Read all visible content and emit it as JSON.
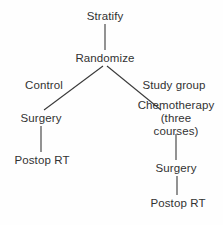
{
  "figure": {
    "type": "flowchart",
    "background_color": "#fefefe",
    "line_color": "#3a3a3a",
    "text_color": "#323232"
  },
  "nodes": [
    {
      "id": "stratify",
      "label": "Stratify",
      "x": 105,
      "y": 16
    },
    {
      "id": "randomize",
      "label": "Randomize",
      "x": 105,
      "y": 58
    },
    {
      "id": "surgery_control",
      "label": "Surgery",
      "x": 41,
      "y": 118
    },
    {
      "id": "chemotherapy",
      "label": "Chemotherapy",
      "line2": "(three courses)",
      "x": 176,
      "y": 118
    },
    {
      "id": "postop_rt_control",
      "label": "Postop RT",
      "x": 42,
      "y": 160
    },
    {
      "id": "surgery_study",
      "label": "Surgery",
      "x": 176,
      "y": 168
    },
    {
      "id": "postop_rt_study",
      "label": "Postop RT",
      "x": 178,
      "y": 203
    }
  ],
  "edge_labels": [
    {
      "id": "control_arm",
      "label": "Control",
      "x": 44,
      "y": 85
    },
    {
      "id": "study_arm",
      "label": "Study group",
      "x": 174,
      "y": 85
    }
  ],
  "edges": [
    {
      "id": "stratify-to-randomize",
      "from": "stratify",
      "to": "randomize",
      "kind": "vertical",
      "x1": 105,
      "y1": 24,
      "x2": 105,
      "y2": 50
    },
    {
      "id": "randomize-to-surgery-control",
      "from": "randomize",
      "to": "surgery_control",
      "kind": "diagonal",
      "x1": 103,
      "y1": 66,
      "x2": 44,
      "y2": 110
    },
    {
      "id": "randomize-to-chemotherapy",
      "from": "randomize",
      "to": "chemotherapy",
      "kind": "diagonal",
      "x1": 107,
      "y1": 66,
      "x2": 161,
      "y2": 110
    },
    {
      "id": "surgery-to-postop-control",
      "from": "surgery_control",
      "to": "postop_rt_control",
      "kind": "vertical",
      "x1": 41,
      "y1": 126,
      "x2": 41,
      "y2": 152
    },
    {
      "id": "chemotherapy-to-surgery-study",
      "from": "chemotherapy",
      "to": "surgery_study",
      "kind": "vertical",
      "x1": 176,
      "y1": 133,
      "x2": 176,
      "y2": 160
    },
    {
      "id": "surgery-to-postop-study",
      "from": "surgery_study",
      "to": "postop_rt_study",
      "kind": "vertical",
      "x1": 177,
      "y1": 176,
      "x2": 177,
      "y2": 195
    }
  ]
}
